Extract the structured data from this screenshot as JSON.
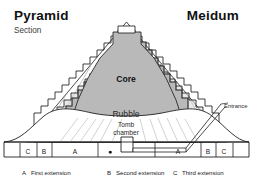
{
  "header": {
    "title_left": "Pyramid",
    "subtitle_left": "Section",
    "title_right": "Meidum"
  },
  "diagram": {
    "labels": {
      "core": "Core",
      "rubble": "Rubble",
      "tomb_chamber_line1": "Tomb",
      "tomb_chamber_line2": "chamber",
      "entrance": "Entrance"
    },
    "scale_marks_left": [
      "C",
      "B",
      "A"
    ],
    "scale_marks_right": [
      "A",
      "B",
      "C"
    ],
    "center_marker": "●"
  },
  "legend": {
    "items": [
      {
        "key": "A",
        "text": "First extension"
      },
      {
        "key": "B",
        "text": "Second extension"
      },
      {
        "key": "C",
        "text": "Third extension"
      }
    ]
  },
  "colors": {
    "core_fill": "#b9b9b9",
    "mantle_fill": "#d2d2d2",
    "outline": "#1f1f1f",
    "hatch": "#8a8a8a",
    "background": "#ffffff"
  }
}
